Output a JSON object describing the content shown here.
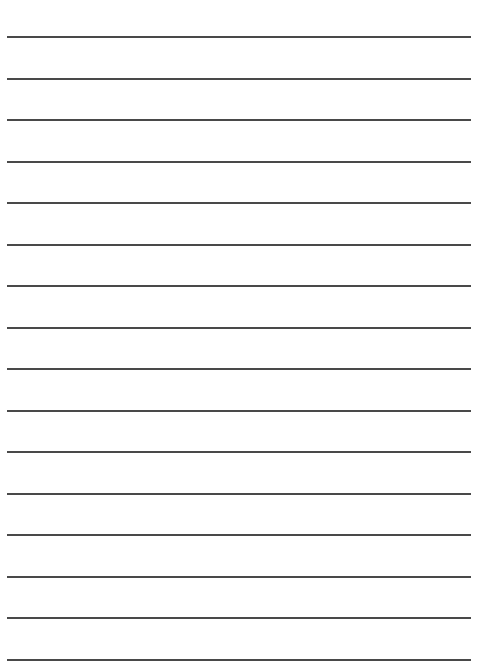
{
  "page": {
    "type": "lined-paper",
    "background_color": "#ffffff",
    "line_color": "#3a3a3a",
    "line_count": 16,
    "lines": [
      {
        "y": 36
      },
      {
        "y": 77.5
      },
      {
        "y": 119
      },
      {
        "y": 160.5
      },
      {
        "y": 202
      },
      {
        "y": 243.5
      },
      {
        "y": 285
      },
      {
        "y": 326.5
      },
      {
        "y": 368
      },
      {
        "y": 409.5
      },
      {
        "y": 451
      },
      {
        "y": 492.5
      },
      {
        "y": 534
      },
      {
        "y": 575.5
      },
      {
        "y": 617
      },
      {
        "y": 658.5
      }
    ]
  }
}
